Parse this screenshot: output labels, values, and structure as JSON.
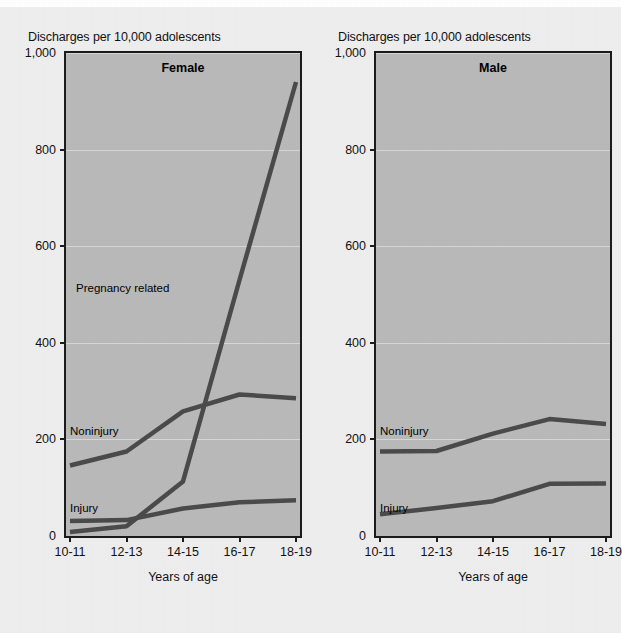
{
  "figure": {
    "background_color": "#eeeeee",
    "plot_background_color": "#b9b9b9",
    "line_color": "#4a4a4a",
    "axis_color": "#1a1a1a",
    "axis_caption": "Discharges per 10,000 adolescents",
    "xaxis_title": "Years of age"
  },
  "chart_data": [
    {
      "type": "line",
      "title": "Female",
      "panel": "left",
      "xlabel": "Years of age",
      "ylabel": "Discharges per 10,000 adolescents",
      "categories": [
        "10-11",
        "12-13",
        "14-15",
        "16-17",
        "18-19"
      ],
      "yticks": [
        "0",
        "200",
        "400",
        "600",
        "800",
        "1,000"
      ],
      "ytick_values": [
        0,
        200,
        400,
        600,
        800,
        1000
      ],
      "ylim": [
        0,
        1000
      ],
      "grid": true,
      "legend": "inline-labels",
      "series": [
        {
          "name": "Pregnancy related",
          "values": [
            8,
            20,
            113,
            530,
            940
          ]
        },
        {
          "name": "Noninjury",
          "values": [
            146,
            175,
            258,
            293,
            285
          ]
        },
        {
          "name": "Injury",
          "values": [
            31,
            33,
            57,
            70,
            74
          ]
        }
      ]
    },
    {
      "type": "line",
      "title": "Male",
      "panel": "right",
      "xlabel": "Years of age",
      "ylabel": "Discharges per 10,000 adolescents",
      "categories": [
        "10-11",
        "12-13",
        "14-15",
        "16-17",
        "18-19"
      ],
      "yticks": [
        "0",
        "200",
        "400",
        "600",
        "800",
        "1,000"
      ],
      "ytick_values": [
        0,
        200,
        400,
        600,
        800,
        1000
      ],
      "ylim": [
        0,
        1000
      ],
      "grid": true,
      "legend": "inline-labels",
      "series": [
        {
          "name": "Noninjury",
          "values": [
            175,
            176,
            212,
            242,
            232
          ]
        },
        {
          "name": "Injury",
          "values": [
            45,
            58,
            72,
            108,
            109
          ]
        }
      ]
    }
  ],
  "left": {
    "caption": "Discharges per 10,000 adolescents",
    "title": "Female",
    "xaxis_title": "Years of age",
    "labels": {
      "pregnancy": "Pregnancy related",
      "noninjury": "Noninjury",
      "injury": "Injury"
    }
  },
  "right": {
    "caption": "Discharges per 10,000 adolescents",
    "title": "Male",
    "xaxis_title": "Years of age",
    "labels": {
      "noninjury": "Noninjury",
      "injury": "Injury"
    }
  }
}
